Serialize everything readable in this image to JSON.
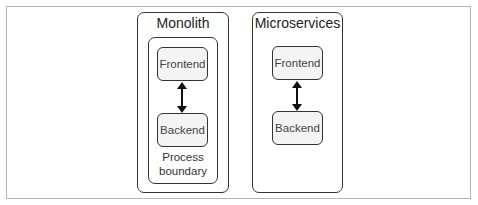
{
  "diagram": {
    "monolith": {
      "title": "Monolith",
      "boundary_label_line1": "Process",
      "boundary_label_line2": "boundary",
      "frontend": "Frontend",
      "backend": "Backend"
    },
    "microservices": {
      "title": "Microservices",
      "frontend": "Frontend",
      "backend": "Backend"
    },
    "connector": "bidirectional-arrow-icon",
    "colors": {
      "border": "#333333",
      "node_fill": "#f4f4f4",
      "frame": "#b5b5b5"
    }
  }
}
